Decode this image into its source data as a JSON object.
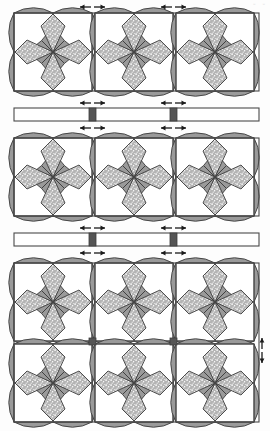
{
  "figure": {
    "corner_label": "▫ ▫"
  },
  "colors": {
    "background": "#fdfdfd",
    "outline": "#4a4a4a",
    "tile_fill": "#ffffff",
    "petal_solid": "#9a9a9a",
    "petal_speckle_base": "#bdbdbd",
    "speckle_dot": "#ffffff",
    "joint_block": "#555555",
    "rail_fill": "#ffffff",
    "rail_outline": "#4a4a4a",
    "arrow_color": "#1a1a1a"
  },
  "geometry": {
    "canvas_width": 270,
    "canvas_height": 431,
    "tile_size": 78,
    "grid_gap": 3,
    "joint_block_size": 7,
    "rail_height": 13
  },
  "panels": [
    {
      "id": "panel-top",
      "name": "Upper Tile Panel",
      "x": 14,
      "y": 13,
      "columns": 3,
      "rows": 1,
      "tile_count": 3,
      "dimension_markers": 2
    },
    {
      "id": "panel-middle",
      "name": "Middle Tile Panel",
      "x": 14,
      "y": 138,
      "columns": 3,
      "rows": 1,
      "tile_count": 3,
      "dimension_markers": 2
    },
    {
      "id": "panel-bottom",
      "name": "Lower Tile Panel",
      "x": 14,
      "y": 263,
      "columns": 3,
      "rows": 2,
      "tile_count": 6,
      "dimension_markers": 2
    }
  ],
  "rails": [
    {
      "id": "rail-upper",
      "name": "Upper Spacer Rail",
      "x": 14,
      "y": 108,
      "width": 245,
      "height": 13,
      "blocks": 2,
      "dimension_markers_above": 2,
      "dimension_markers_below": 2
    },
    {
      "id": "rail-lower",
      "name": "Lower Spacer Rail",
      "x": 14,
      "y": 233,
      "width": 245,
      "height": 13,
      "blocks": 2,
      "dimension_markers_above": 2,
      "dimension_markers_below": 2
    }
  ],
  "tile_motif": {
    "name": "eight-point-star",
    "petal_count": 8,
    "solid_petals": 4,
    "speckled_petals": 4,
    "corner_style": "concave-quarter-arc",
    "corners": 4
  },
  "annotations": {
    "side_marker": {
      "id": "right-edge-marker",
      "name": "Right Edge Dimension Marker",
      "x": 260,
      "y": 327,
      "orientation": "vertical"
    }
  }
}
